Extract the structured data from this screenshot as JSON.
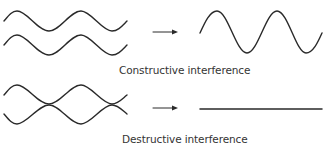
{
  "diagram": {
    "colors": {
      "stroke": "#2a2a2a",
      "text": "#333333",
      "background": "#ffffff"
    },
    "panels": [
      {
        "id": "constructive",
        "label": "Constructive interference",
        "inputs": [
          {
            "name": "wave-a",
            "phase": "in-phase",
            "amplitude": "small"
          },
          {
            "name": "wave-b",
            "phase": "in-phase",
            "amplitude": "small"
          }
        ],
        "arrow": "right-arrow",
        "result": {
          "type": "wave",
          "amplitude": "doubled"
        }
      },
      {
        "id": "destructive",
        "label": "Destructive interference",
        "inputs": [
          {
            "name": "wave-a",
            "phase": "0",
            "amplitude": "small"
          },
          {
            "name": "wave-b",
            "phase": "180",
            "amplitude": "small"
          }
        ],
        "arrow": "right-arrow",
        "result": {
          "type": "flat-line",
          "amplitude": "zero"
        }
      }
    ]
  }
}
